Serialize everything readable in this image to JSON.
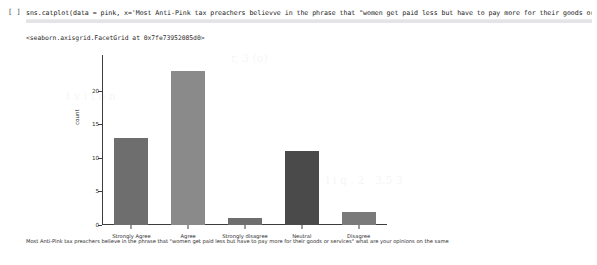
{
  "notebook": {
    "prompt_label": "[ ]",
    "code": "sns.catplot(data = pink, x='Most Anti-Pink tax preachers believve in the phrase that \"women get paid less but have to pay more for their goods or services\"",
    "output_repr": "<seaborn.axisgrid.FacetGrid at 0x7fe73952085d0>"
  },
  "chart_data": {
    "type": "bar",
    "title": "",
    "subtitle": "",
    "categories": [
      "Strongly Agree",
      "Agree",
      "Strongly disagree",
      "Neutral",
      "Disagree"
    ],
    "values": [
      13,
      23,
      1,
      11,
      2
    ],
    "bar_colors": [
      "#6e6e6e",
      "#8a8a8a",
      "#6e6e6e",
      "#4a4a4a",
      "#7a7a7a"
    ],
    "xlabel": "Most Anti-Pink tax preachers believe in the phrase that \"women get paid less but have to pay more for their goods or services\" what are your opinions on the same",
    "ylabel": "count",
    "ylim": [
      0,
      24
    ],
    "yticks": [
      0,
      5,
      10,
      15,
      20
    ],
    "ytick_labels": [
      "0",
      "5",
      "10",
      "15",
      "20"
    ],
    "grid": false,
    "legend": "none",
    "axis_color": "#3c3c3c"
  }
}
